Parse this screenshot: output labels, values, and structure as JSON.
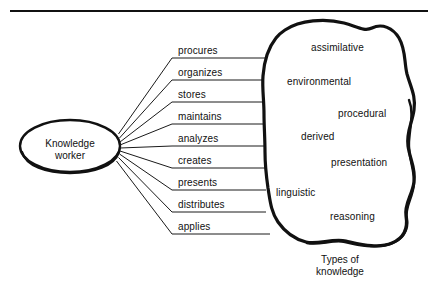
{
  "figure": {
    "top_rule": {
      "present": true
    },
    "source_node": {
      "label_line_1": "Knowledge",
      "label_line_2": "worker",
      "shape": "ellipse"
    },
    "verbs": [
      {
        "label": "procures"
      },
      {
        "label": "organizes"
      },
      {
        "label": "stores"
      },
      {
        "label": "maintains"
      },
      {
        "label": "analyzes"
      },
      {
        "label": "creates"
      },
      {
        "label": "presents"
      },
      {
        "label": "distributes"
      },
      {
        "label": "applies"
      }
    ],
    "knowledge_types": [
      {
        "label": "assimilative"
      },
      {
        "label": "environmental"
      },
      {
        "label": "procedural"
      },
      {
        "label": "derived"
      },
      {
        "label": "presentation"
      },
      {
        "label": "linguistic"
      },
      {
        "label": "reasoning"
      }
    ],
    "caption": {
      "line_1": "Types of",
      "line_2": "knowledge"
    },
    "colors": {
      "ink": "#111111",
      "background": "#ffffff",
      "thin_stroke": "#1a1a1a"
    }
  }
}
